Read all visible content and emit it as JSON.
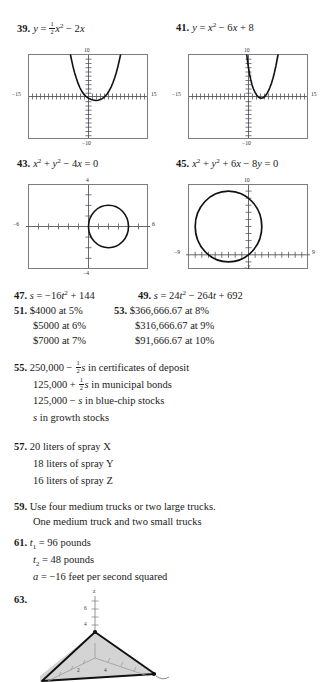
{
  "page": {
    "background": "#ffffff",
    "ink": "#1a1a1a",
    "axis_color": "#55555f",
    "frame_color": "#7b7b86",
    "curve_color": "#111111"
  },
  "exercises": {
    "e39": {
      "number": "39.",
      "equation_parts": {
        "lhs": "y",
        "eq": "=",
        "coef_num": "1",
        "coef_den": "2",
        "var": "x",
        "exp": "2",
        "minus": "−",
        "term2": "2x"
      },
      "equation_text": "y = ½x² − 2x",
      "graph": {
        "xlabel_left": "−15",
        "xlabel_right": "15",
        "ylabel_top": "10",
        "ylabel_bottom": "−10",
        "xmin": -15,
        "xmax": 15,
        "ymin": -10,
        "ymax": 10,
        "type": "parabola",
        "a": 0.5,
        "b": -2,
        "c": 0,
        "vertex": [
          2,
          -2
        ],
        "x_tick_step": 1,
        "y_tick_step": 1
      }
    },
    "e41": {
      "number": "41.",
      "equation_text": "y = x² − 6x + 8",
      "graph": {
        "xlabel_left": "−15",
        "xlabel_right": "15",
        "ylabel_top": "10",
        "ylabel_bottom": "−10",
        "xmin": -15,
        "xmax": 15,
        "ymin": -10,
        "ymax": 10,
        "type": "parabola",
        "a": 1,
        "b": -6,
        "c": 8,
        "vertex": [
          3,
          -1
        ],
        "x_tick_step": 1,
        "y_tick_step": 1
      }
    },
    "e43": {
      "number": "43.",
      "equation_text": "x² + y² − 4x = 0",
      "graph": {
        "xlabel_left": "−6",
        "xlabel_right": "6",
        "ylabel_top": "4",
        "ylabel_bottom": "−4",
        "xmin": -6,
        "xmax": 6,
        "ymin": -4,
        "ymax": 4,
        "type": "circle",
        "center": [
          2,
          0
        ],
        "radius": 2,
        "x_tick_step": 1,
        "y_tick_step": 1
      }
    },
    "e45": {
      "number": "45.",
      "equation_text": "x² + y² + 6x − 8y = 0",
      "graph": {
        "xlabel_left": "−9",
        "xlabel_right": "9",
        "ylabel_top": "10",
        "ylabel_bottom": "−2",
        "xmin": -9,
        "xmax": 9,
        "ymin": -2,
        "ymax": 10,
        "type": "circle",
        "center": [
          -3,
          4
        ],
        "radius": 5,
        "x_tick_step": 1,
        "y_tick_step": 1
      }
    },
    "e47": {
      "number": "47.",
      "answer_text": "s = −16t² + 144"
    },
    "e49": {
      "number": "49.",
      "answer_text": "s = 24t² − 264t + 692"
    },
    "e51": {
      "number": "51.",
      "lines": [
        "$4000 at 5%",
        "$5000 at 6%",
        "$7000 at 7%"
      ]
    },
    "e53": {
      "number": "53.",
      "lines": [
        "$366,666.67 at 8%",
        "$316,666.67 at 9%",
        "$91,666.67 at 10%"
      ]
    },
    "e55": {
      "number": "55.",
      "lines": [
        "250,000 − ½s in certificates of deposit",
        "125,000 + ½s in municipal bonds",
        "125,000 − s in blue-chip stocks",
        "s in growth stocks"
      ],
      "line1": {
        "pre": "250,000",
        "op": "−",
        "num": "1",
        "den": "2",
        "var": "s",
        "post": "in certificates of deposit"
      },
      "line2": {
        "pre": "125,000",
        "op": "+",
        "num": "1",
        "den": "2",
        "var": "s",
        "post": "in municipal bonds"
      },
      "line3": {
        "pre": "125,000",
        "op": "−",
        "var": "s",
        "post": "in blue-chip stocks"
      },
      "line4": {
        "var": "s",
        "post": "in growth stocks"
      }
    },
    "e57": {
      "number": "57.",
      "lines": [
        "20 liters of spray X",
        "18 liters of spray Y",
        "16 liters of spray Z"
      ]
    },
    "e59": {
      "number": "59.",
      "lines": [
        "Use four medium trucks or two large trucks.",
        "One medium truck and two small trucks"
      ]
    },
    "e61": {
      "number": "61.",
      "line1": {
        "var": "t",
        "sub": "1",
        "eq": "=",
        "value": "96 pounds"
      },
      "line2": {
        "var": "t",
        "sub": "2",
        "eq": "=",
        "value": "48 pounds"
      },
      "line3": {
        "var": "a",
        "eq": "=",
        "value": "−16 feet per second squared"
      }
    },
    "e63": {
      "number": "63.",
      "figure": {
        "z_axis_label": "z",
        "z_ticks": [
          "6",
          "4"
        ],
        "x_ticks": [
          "2",
          "4"
        ],
        "shaded": true,
        "fill_color": "#d4d4d4",
        "edge_color": "#111111",
        "axis_color": "#8a8a8a"
      }
    }
  }
}
